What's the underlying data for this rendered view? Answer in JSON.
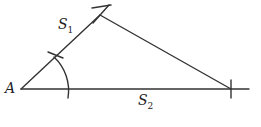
{
  "labels": {
    "vertex": "A",
    "side1": "S",
    "side1_sub": "1",
    "side2": "S",
    "side2_sub": "2"
  },
  "colors": {
    "stroke": "#333333",
    "text": "#222222"
  }
}
